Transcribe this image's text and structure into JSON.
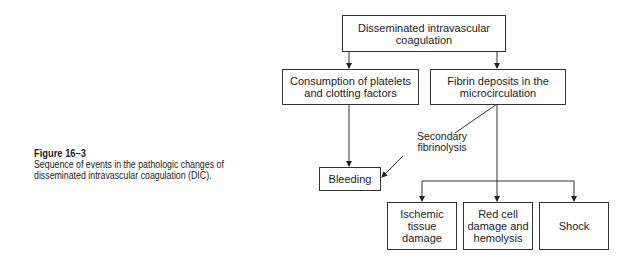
{
  "caption": {
    "figure_label": "Figure 16–3",
    "description": "Sequence of events in the pathologic changes of disseminated intravascular coagulation (DIC)."
  },
  "diagram": {
    "nodes": {
      "dic": "Disseminated intravascular coagulation",
      "consumption": "Consumption of platelets and clotting factors",
      "fibrin": "Fibrin deposits in the microcirculation",
      "bleeding": "Bleeding",
      "ischemic": "Ischemic tissue damage",
      "redcell": "Red cell damage and hemolysis",
      "shock": "Shock"
    },
    "edge_labels": {
      "secondary_fibrinolysis": "Secondary fibrinolysis"
    },
    "edges": [
      {
        "from": "dic",
        "to": "consumption"
      },
      {
        "from": "dic",
        "to": "fibrin"
      },
      {
        "from": "consumption",
        "to": "bleeding"
      },
      {
        "from": "fibrin",
        "to": "bleeding",
        "label": "Secondary fibrinolysis"
      },
      {
        "from": "fibrin",
        "to": "ischemic"
      },
      {
        "from": "fibrin",
        "to": "redcell"
      },
      {
        "from": "fibrin",
        "to": "shock"
      }
    ]
  }
}
